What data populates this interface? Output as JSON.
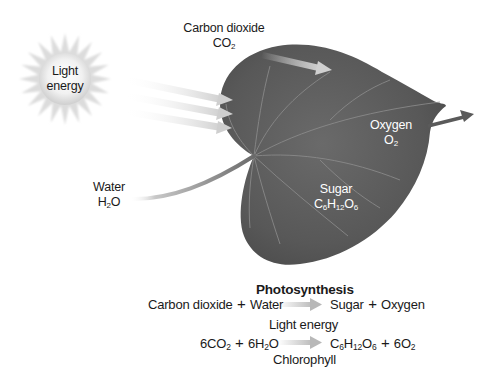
{
  "diagram": {
    "title": "Photosynthesis",
    "labels": {
      "light": {
        "line1": "Light",
        "line2": "energy"
      },
      "carbon_dioxide": {
        "name": "Carbon dioxide",
        "formula": {
          "base": "CO",
          "sub": "2"
        }
      },
      "oxygen": {
        "name": "Oxygen",
        "formula": {
          "base": "O",
          "sub": "2"
        }
      },
      "water": {
        "name": "Water",
        "formula": {
          "pre": "H",
          "sub": "2",
          "post": "O"
        }
      },
      "sugar": {
        "name": "Sugar",
        "formula": {
          "c": "C",
          "c_sub": "6",
          "h": "H",
          "h_sub": "12",
          "o": "O",
          "o_sub": "6"
        }
      }
    },
    "word_equation": {
      "reactant1": "Carbon dioxide",
      "plus1": "+",
      "reactant2": "Water",
      "product1": "Sugar",
      "plus2": "+",
      "product2": "Oxygen"
    },
    "chemical_equation": {
      "above_arrow": "Light energy",
      "below_arrow": "Chlorophyll",
      "r1_coef": "6",
      "r1_base": "CO",
      "r1_sub": "2",
      "plus1": "+",
      "r2_coef": "6H",
      "r2_sub": "2",
      "r2_post": "O",
      "p1_c": "C",
      "p1_c_sub": "6",
      "p1_h": "H",
      "p1_h_sub": "12",
      "p1_o": "O",
      "p1_o_sub": "6",
      "plus2": "+",
      "p2_coef": "6O",
      "p2_sub": "2"
    },
    "colors": {
      "leaf": "#5e5e5e",
      "leaf_dark": "#4a4a4a",
      "vein": "#8c8c8c",
      "arrow_light": "#cfcfcf",
      "arrow_dark": "#5a5a5a",
      "sun": "#e2e2e2"
    }
  }
}
